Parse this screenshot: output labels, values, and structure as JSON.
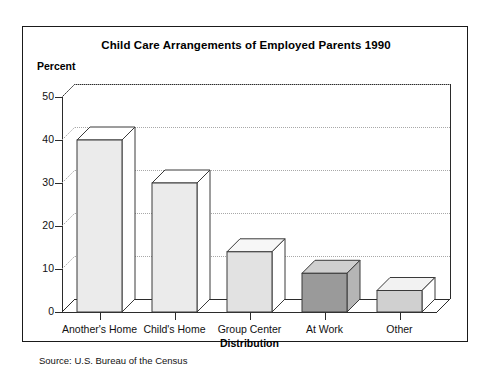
{
  "figure": {
    "title": "Child Care Arrangements of Employed Parents 1990",
    "y_axis_title": "Percent",
    "x_axis_title": "Distribution",
    "source_note": "Source: U.S. Bureau of the Census",
    "frame_border_color": "#1a1a1a",
    "background_color": "#ffffff"
  },
  "chart_data": {
    "type": "bar",
    "title": "Child Care Arrangements of Employed Parents 1990",
    "subtitle": "",
    "xlabel": "Distribution",
    "ylabel": "Percent",
    "categories": [
      "Another's Home",
      "Child's Home",
      "Group Center",
      "At Work",
      "Other"
    ],
    "values": [
      40,
      30,
      14,
      9,
      5
    ],
    "value_labels": [
      "40",
      "30",
      "14",
      "9",
      "5"
    ],
    "ylim": [
      0,
      50
    ],
    "ytick_labels": [
      "0",
      "10",
      "20",
      "30",
      "40",
      "50"
    ],
    "ytick_values": [
      0,
      10,
      20,
      30,
      40,
      50
    ],
    "grid": true,
    "grid_style": "dotted-horizontal",
    "legend": false,
    "legend_position": "none",
    "three_d": true,
    "bar_colors": [
      "#ebebeb",
      "#ebebeb",
      "#e2e2e2",
      "#9a9a9a",
      "#d0d0d0"
    ],
    "bar_top_colors": [
      "#ffffff",
      "#ffffff",
      "#f7f7f7",
      "#cfcfcf",
      "#f2f2f2"
    ],
    "bar_side_colors": [
      "#ffffff",
      "#ffffff",
      "#ffffff",
      "#b5b5b5",
      "#ffffff"
    ],
    "bar_edge_color": "#3a3a3a",
    "axis_color": "#2b2b2b",
    "gridline_color": "#a8a8a8",
    "annotations": [
      "Source: U.S. Bureau of the Census"
    ]
  }
}
